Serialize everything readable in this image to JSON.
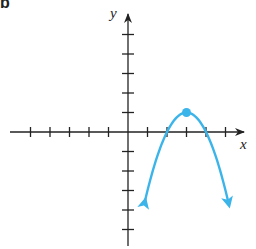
{
  "chart_data": {
    "type": "line",
    "title": "",
    "xlabel": "x",
    "ylabel": "y",
    "xlim": [
      -5,
      5
    ],
    "ylim": [
      -5,
      5
    ],
    "x_ticks": [
      -5,
      -4,
      -3,
      -2,
      -1,
      1,
      2,
      3,
      4,
      5
    ],
    "y_ticks": [
      -5,
      -4,
      -3,
      -2,
      -1,
      1,
      2,
      3,
      4,
      5
    ],
    "tick_labels_shown": false,
    "grid": false,
    "series": [
      {
        "name": "parabola",
        "equation": "y = -(x - 3)^2 + 1",
        "color": "#3bb4ea",
        "x": [
          0.85,
          1,
          1.5,
          2,
          2.5,
          3,
          3.5,
          4,
          4.5,
          5,
          5.15
        ],
        "y": [
          -3.62,
          -3,
          -1.25,
          0,
          0.75,
          1,
          0.75,
          0,
          -1.25,
          -3,
          -3.62
        ],
        "arrows_at_ends": true
      }
    ],
    "annotations": [
      {
        "type": "point",
        "label": "vertex",
        "x": 3,
        "y": 1,
        "color": "#3bb4ea"
      }
    ]
  },
  "labels": {
    "x_axis": "x",
    "y_axis": "y",
    "corner": "b"
  },
  "colors": {
    "curve": "#3bb4ea",
    "axis": "#222222"
  }
}
